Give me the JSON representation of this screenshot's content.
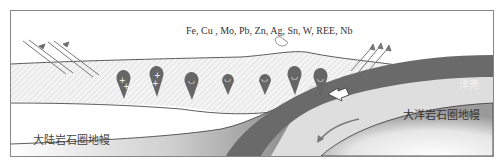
{
  "diagram": {
    "title": "",
    "elements_label": "Fe, Cu , Mo, Pb, Zn, Ag, Sn, W, REE, Nb",
    "labels": {
      "continental_lithosphere": "大陆岩石圈地幔",
      "oceanic_lithosphere": "大洋岩石圈地幔",
      "oceanic_crust": "洋壳"
    },
    "plutons": [
      {
        "x": 112,
        "y": 72,
        "symbol": "+"
      },
      {
        "x": 145,
        "y": 68,
        "symbol": "+"
      },
      {
        "x": 180,
        "y": 74,
        "symbol": "~"
      },
      {
        "x": 217,
        "y": 72,
        "symbol": "~"
      },
      {
        "x": 254,
        "y": 72,
        "symbol": "~"
      },
      {
        "x": 284,
        "y": 68,
        "symbol": "~"
      },
      {
        "x": 310,
        "y": 70,
        "symbol": "~"
      }
    ],
    "colors": {
      "slab": "#6a6a6a",
      "mantle_light": "#d8d8d8",
      "crust_hatch": "#e4e4e4",
      "arrow": "#777777"
    }
  }
}
